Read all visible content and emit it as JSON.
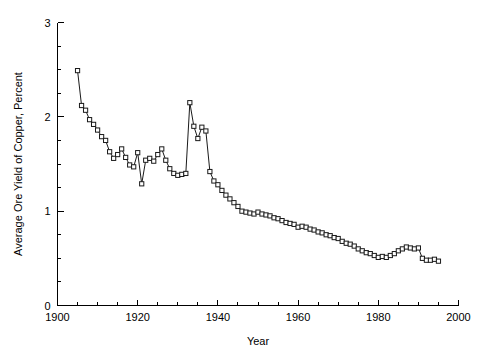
{
  "chart_data": {
    "type": "line",
    "title": "",
    "xlabel": "Year",
    "ylabel": "Average Ore Yield of Copper, Percent",
    "xlim": [
      1900,
      2000
    ],
    "ylim": [
      0,
      3
    ],
    "xticks": [
      1900,
      1920,
      1940,
      1960,
      1980,
      2000
    ],
    "xtick_labels": [
      "1900",
      "1920",
      "1940",
      "1960",
      "1980",
      "2000"
    ],
    "xminor_step": 5,
    "yticks": [
      0,
      1,
      2,
      3
    ],
    "ytick_labels": [
      "0",
      "1",
      "2",
      "3"
    ],
    "yminor_step": 0.25,
    "grid": false,
    "legend": null,
    "marker": "open-square",
    "line_color": "#1a1a1a",
    "marker_face_color": "#ffffff",
    "series": [
      {
        "name": "Average ore yield of copper",
        "x": [
          1905,
          1906,
          1907,
          1908,
          1909,
          1910,
          1911,
          1912,
          1913,
          1914,
          1915,
          1916,
          1917,
          1918,
          1919,
          1920,
          1921,
          1922,
          1923,
          1924,
          1925,
          1926,
          1927,
          1928,
          1929,
          1930,
          1931,
          1932,
          1933,
          1934,
          1935,
          1936,
          1937,
          1938,
          1939,
          1940,
          1941,
          1942,
          1943,
          1944,
          1945,
          1946,
          1947,
          1948,
          1949,
          1950,
          1951,
          1952,
          1953,
          1954,
          1955,
          1956,
          1957,
          1958,
          1959,
          1960,
          1961,
          1962,
          1963,
          1964,
          1965,
          1966,
          1967,
          1968,
          1969,
          1970,
          1971,
          1972,
          1973,
          1974,
          1975,
          1976,
          1977,
          1978,
          1979,
          1980,
          1981,
          1982,
          1983,
          1984,
          1985,
          1986,
          1987,
          1988,
          1989,
          1990,
          1991,
          1992,
          1993,
          1994,
          1995
        ],
        "y": [
          2.49,
          2.12,
          2.07,
          1.97,
          1.92,
          1.86,
          1.79,
          1.75,
          1.63,
          1.56,
          1.6,
          1.66,
          1.57,
          1.49,
          1.47,
          1.62,
          1.29,
          1.54,
          1.56,
          1.53,
          1.6,
          1.66,
          1.54,
          1.45,
          1.4,
          1.38,
          1.39,
          1.4,
          2.15,
          1.9,
          1.77,
          1.89,
          1.85,
          1.42,
          1.32,
          1.28,
          1.22,
          1.17,
          1.13,
          1.09,
          1.05,
          1.0,
          0.99,
          0.98,
          0.97,
          0.99,
          0.97,
          0.96,
          0.95,
          0.93,
          0.92,
          0.9,
          0.88,
          0.87,
          0.86,
          0.83,
          0.84,
          0.83,
          0.81,
          0.8,
          0.78,
          0.77,
          0.75,
          0.74,
          0.72,
          0.71,
          0.68,
          0.66,
          0.65,
          0.63,
          0.6,
          0.58,
          0.56,
          0.55,
          0.53,
          0.51,
          0.52,
          0.51,
          0.53,
          0.55,
          0.58,
          0.6,
          0.62,
          0.61,
          0.6,
          0.61,
          0.5,
          0.48,
          0.48,
          0.49,
          0.47
        ]
      }
    ]
  }
}
